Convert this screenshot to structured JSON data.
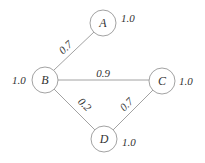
{
  "diagram": {
    "type": "weighted-graph",
    "nodes": [
      {
        "id": "A",
        "label": "A",
        "weight": "1.0"
      },
      {
        "id": "B",
        "label": "B",
        "weight": "1.0"
      },
      {
        "id": "C",
        "label": "C",
        "weight": "1.0"
      },
      {
        "id": "D",
        "label": "D",
        "weight": "1.0"
      }
    ],
    "edges": [
      {
        "from": "A",
        "to": "B",
        "label": "0.7"
      },
      {
        "from": "B",
        "to": "C",
        "label": "0.9"
      },
      {
        "from": "B",
        "to": "D",
        "label": "0.2"
      },
      {
        "from": "C",
        "to": "D",
        "label": "0.7"
      }
    ]
  }
}
